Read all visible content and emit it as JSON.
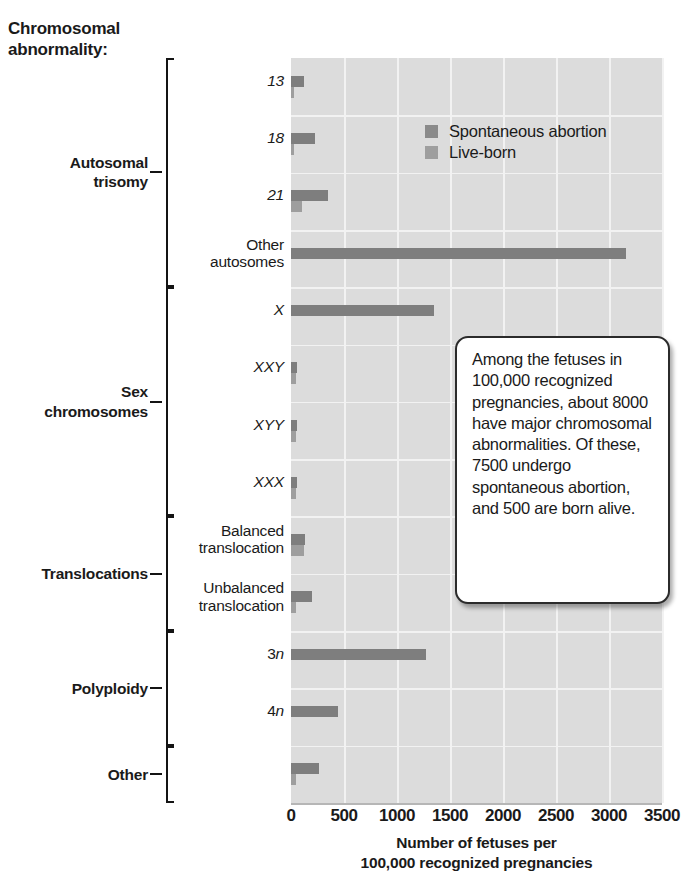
{
  "title": "Chromosomal\nabnormality:",
  "legend": {
    "items": [
      {
        "label": "Spontaneous abortion",
        "color": "#8a8a8a",
        "key": "spontaneous_abortion"
      },
      {
        "label": "Live-born",
        "color": "#9e9e9e",
        "key": "live_born"
      }
    ]
  },
  "callout": {
    "text": "Among the fetuses in 100,000 recognized pregnancies, about 8000 have major chromosomal abnormalities. Of these, 7500 undergo spontaneous abortion, and 500 are born alive."
  },
  "groups": [
    {
      "label": "Autosomal\ntrisomy",
      "first": 0,
      "last": 3
    },
    {
      "label": "Sex\nchromosomes",
      "first": 4,
      "last": 7
    },
    {
      "label": "Translocations",
      "first": 8,
      "last": 9
    },
    {
      "label": "Polyploidy",
      "first": 10,
      "last": 11
    },
    {
      "label": "Other",
      "first": 12,
      "last": 12
    }
  ],
  "xaxis": {
    "title": "Number of fetuses per\n100,000 recognized pregnancies",
    "ticks": [
      "0",
      "500",
      "1000",
      "1500",
      "2000",
      "2500",
      "3000",
      "3500"
    ],
    "min": 0,
    "max": 3500,
    "step": 500
  },
  "chart_data": {
    "type": "bar",
    "orientation": "horizontal",
    "title": "Chromosomal abnormality:",
    "xlabel": "Number of fetuses per 100,000 recognized pregnancies",
    "ylabel": "Chromosomal abnormality",
    "xlim": [
      0,
      3500
    ],
    "grid": true,
    "legend_position": "inside-top-right",
    "categories": [
      "13",
      "18",
      "21",
      "Other autosomes",
      "X",
      "XXY",
      "XYY",
      "XXX",
      "Balanced translocation",
      "Unbalanced translocation",
      "3n",
      "4n",
      "Other"
    ],
    "category_labels": [
      {
        "text": "13",
        "style": "italic"
      },
      {
        "text": "18",
        "style": "italic"
      },
      {
        "text": "21",
        "style": "italic"
      },
      {
        "text": "Other\nautosomes",
        "style": "normal"
      },
      {
        "text": "X",
        "style": "italic"
      },
      {
        "text": "XXY",
        "style": "italic"
      },
      {
        "text": "XYY",
        "style": "italic"
      },
      {
        "text": "XXX",
        "style": "italic"
      },
      {
        "text": "Balanced\ntranslocation",
        "style": "normal"
      },
      {
        "text": "Unbalanced\ntranslocation",
        "style": "normal"
      },
      {
        "text": "3n",
        "style": "italic-n"
      },
      {
        "text": "4n",
        "style": "italic-n"
      },
      {
        "text": "",
        "style": "normal"
      }
    ],
    "series": [
      {
        "name": "Spontaneous abortion",
        "color": "#7e7e7e",
        "values": [
          120,
          225,
          350,
          3160,
          1350,
          55,
          55,
          55,
          130,
          195,
          1275,
          440,
          265
        ]
      },
      {
        "name": "Live-born",
        "color": "#9e9e9e",
        "values": [
          5,
          5,
          100,
          0,
          0,
          50,
          50,
          50,
          125,
          50,
          0,
          0,
          45
        ]
      }
    ],
    "notes": "Among the fetuses in 100,000 recognized pregnancies, about 8000 have major chromosomal abnormalities. Of these, 7500 undergo spontaneous abortion, and 500 are born alive."
  }
}
